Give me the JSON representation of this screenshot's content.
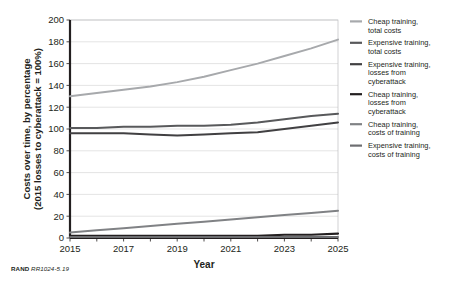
{
  "figure": {
    "footer_org": "RAND",
    "footer_id": "RR1024-5.19"
  },
  "chart_data": {
    "type": "line",
    "title": "",
    "xlabel": "Year",
    "ylabel": "Costs over time, by percentage (2015 losses to cyberattack = 100%)",
    "ylabel_line1": "Costs over time, by percentage",
    "ylabel_line2": "(2015 losses to cyberattack = 100%)",
    "x": [
      2015,
      2016,
      2017,
      2018,
      2019,
      2020,
      2021,
      2022,
      2023,
      2024,
      2025
    ],
    "xlim": [
      2015,
      2025
    ],
    "ylim": [
      0,
      200
    ],
    "xticks": [
      2015,
      2016,
      2017,
      2018,
      2019,
      2020,
      2021,
      2022,
      2023,
      2024,
      2025
    ],
    "xticklabels": [
      "2015",
      "",
      "2017",
      "",
      "2019",
      "",
      "2021",
      "",
      "2023",
      "",
      "2025"
    ],
    "yticks": [
      0,
      20,
      40,
      60,
      80,
      100,
      120,
      140,
      160,
      180,
      200
    ],
    "yticklabels": [
      "0",
      "20",
      "40",
      "60",
      "80",
      "100",
      "120",
      "140",
      "160",
      "180",
      "200"
    ],
    "grid": "horizontal",
    "legend_position": "right",
    "series": [
      {
        "name": "Cheap training, total costs",
        "label_line1": "Cheap training,",
        "label_line2": "total costs",
        "color": "#a7a9ac",
        "width": 2.0,
        "values": [
          130,
          133,
          136,
          139,
          143,
          148,
          154,
          160,
          167,
          174,
          182
        ]
      },
      {
        "name": "Expensive training, total costs",
        "label_line1": "Expensive training,",
        "label_line2": "total costs",
        "color": "#58595b",
        "width": 2.0,
        "values": [
          101,
          101,
          102,
          102,
          103,
          103,
          104,
          106,
          109,
          112,
          114
        ]
      },
      {
        "name": "Expensive training, losses from cyberattack",
        "label_line1": "Expensive training,",
        "label_line2": "losses from",
        "label_line3": "cyberattack",
        "color": "#414042",
        "width": 2.0,
        "values": [
          96,
          96,
          96,
          95,
          94,
          95,
          96,
          97,
          100,
          103,
          106
        ]
      },
      {
        "name": "Cheap training, losses from cyberattack",
        "label_line1": "Cheap training,",
        "label_line2": "losses from",
        "label_line3": "cyberattack",
        "color": "#231f20",
        "width": 2.2,
        "values": [
          2,
          2,
          2,
          2,
          2,
          2,
          2,
          2,
          3,
          3,
          4
        ]
      },
      {
        "name": "Cheap training, costs of training",
        "label_line1": "Cheap training,",
        "label_line2": "costs of training",
        "color": "#808285",
        "width": 2.0,
        "values": [
          5,
          7,
          9,
          11,
          13,
          15,
          17,
          19,
          21,
          23,
          25
        ]
      },
      {
        "name": "Expensive training, costs of training",
        "label_line1": "Expensive training,",
        "label_line2": "costs of training",
        "color": "#6d6e71",
        "width": 2.0,
        "values": [
          1,
          1,
          1,
          1,
          1,
          1,
          1,
          1,
          1,
          1,
          1
        ]
      }
    ]
  }
}
